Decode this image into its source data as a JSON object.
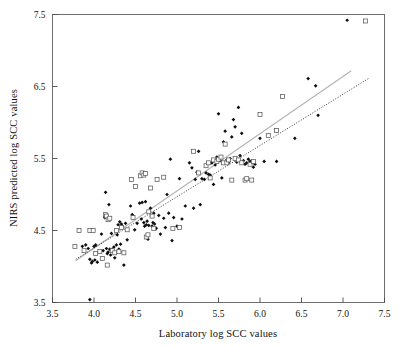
{
  "chart_data": {
    "type": "scatter",
    "title": "",
    "xlabel": "Laboratory log SCC values",
    "ylabel": "NIRS predicted log SCC values",
    "xlim": [
      3.5,
      7.5
    ],
    "ylim": [
      3.5,
      7.5
    ],
    "grid": false,
    "legend_position": "none",
    "xticks": [
      3.5,
      4.0,
      4.5,
      5.0,
      5.5,
      6.0,
      6.5,
      7.0,
      7.5
    ],
    "xtick_labels": [
      "3.5",
      "4.0",
      "4.5",
      "5.0",
      "5.5",
      "6.0",
      "6.5",
      "7.0",
      "7.5"
    ],
    "yticks": [
      3.5,
      4.5,
      5.5,
      6.5,
      7.5
    ],
    "ytick_labels": [
      "3.5",
      "4.5",
      "5.5",
      "6.5",
      "7.5"
    ],
    "marker_colors": {
      "filled_diamond": "#0d0d0d",
      "open_square_edge": "#5a5a5a",
      "open_square_fill": "#ffffff",
      "solid_fit_line": "#b4b4b4",
      "dotted_fit_line": "#2b2b2b",
      "frame": "#6d6d6d"
    },
    "series": [
      {
        "name": "calibration-set",
        "marker": "filled-diamond",
        "points": [
          [
            3.86,
            4.28
          ],
          [
            3.9,
            4.3
          ],
          [
            3.93,
            4.25
          ],
          [
            3.95,
            3.54
          ],
          [
            3.95,
            4.1
          ],
          [
            3.97,
            4.05
          ],
          [
            3.98,
            4.07
          ],
          [
            4.0,
            4.28
          ],
          [
            4.01,
            4.09
          ],
          [
            4.02,
            4.3
          ],
          [
            4.04,
            4.06
          ],
          [
            4.07,
            4.21
          ],
          [
            4.09,
            4.45
          ],
          [
            4.11,
            4.22
          ],
          [
            4.13,
            4.68
          ],
          [
            4.14,
            5.03
          ],
          [
            4.15,
            4.25
          ],
          [
            4.16,
            4.18
          ],
          [
            4.17,
            4.2
          ],
          [
            4.18,
            4.86
          ],
          [
            4.19,
            4.24
          ],
          [
            4.2,
            4.16
          ],
          [
            4.21,
            4.46
          ],
          [
            4.22,
            4.24
          ],
          [
            4.24,
            4.27
          ],
          [
            4.25,
            4.12
          ],
          [
            4.27,
            4.3
          ],
          [
            4.28,
            4.44
          ],
          [
            4.29,
            4.58
          ],
          [
            4.3,
            4.24
          ],
          [
            4.31,
            4.62
          ],
          [
            4.32,
            4.31
          ],
          [
            4.33,
            4.59
          ],
          [
            4.34,
            4.56
          ],
          [
            4.35,
            4.2
          ],
          [
            4.36,
            4.02
          ],
          [
            4.38,
            4.6
          ],
          [
            4.4,
            4.37
          ],
          [
            4.44,
            4.84
          ],
          [
            4.46,
            4.72
          ],
          [
            4.47,
            4.7
          ],
          [
            4.49,
            4.51
          ],
          [
            4.52,
            4.6
          ],
          [
            4.55,
            4.88
          ],
          [
            4.57,
            4.66
          ],
          [
            4.58,
            4.89
          ],
          [
            4.6,
            4.61
          ],
          [
            4.61,
            4.56
          ],
          [
            4.62,
            4.9
          ],
          [
            4.63,
            4.58
          ],
          [
            4.64,
            4.63
          ],
          [
            4.65,
            4.38
          ],
          [
            4.66,
            4.57
          ],
          [
            4.67,
            4.76
          ],
          [
            4.68,
            4.81
          ],
          [
            4.69,
            4.7
          ],
          [
            4.7,
            4.56
          ],
          [
            4.71,
            4.61
          ],
          [
            4.72,
            4.74
          ],
          [
            4.73,
            4.59
          ],
          [
            4.75,
            4.53
          ],
          [
            4.78,
            4.71
          ],
          [
            4.8,
            4.45
          ],
          [
            4.84,
            4.67
          ],
          [
            4.86,
            4.54
          ],
          [
            4.88,
            5.0
          ],
          [
            4.9,
            4.74
          ],
          [
            4.92,
            5.49
          ],
          [
            4.94,
            4.36
          ],
          [
            4.96,
            4.68
          ],
          [
            5.0,
            4.56
          ],
          [
            5.03,
            5.22
          ],
          [
            5.06,
            4.66
          ],
          [
            5.1,
            4.84
          ],
          [
            5.15,
            5.44
          ],
          [
            5.18,
            5.37
          ],
          [
            5.2,
            4.81
          ],
          [
            5.22,
            5.21
          ],
          [
            5.24,
            5.31
          ],
          [
            5.26,
            5.6
          ],
          [
            5.28,
            4.86
          ],
          [
            5.3,
            5.22
          ],
          [
            5.33,
            5.21
          ],
          [
            5.35,
            5.3
          ],
          [
            5.38,
            5.28
          ],
          [
            5.4,
            5.27
          ],
          [
            5.42,
            5.44
          ],
          [
            5.44,
            5.14
          ],
          [
            5.46,
            5.41
          ],
          [
            5.48,
            5.52
          ],
          [
            5.5,
            6.12
          ],
          [
            5.52,
            5.47
          ],
          [
            5.54,
            5.23
          ],
          [
            5.56,
            5.73
          ],
          [
            5.58,
            5.88
          ],
          [
            5.6,
            5.48
          ],
          [
            5.62,
            5.44
          ],
          [
            5.64,
            5.5
          ],
          [
            5.66,
            5.8
          ],
          [
            5.68,
            6.04
          ],
          [
            5.7,
            5.94
          ],
          [
            5.72,
            5.45
          ],
          [
            5.74,
            6.21
          ],
          [
            5.76,
            5.54
          ],
          [
            5.78,
            5.85
          ],
          [
            5.8,
            5.47
          ],
          [
            5.82,
            5.42
          ],
          [
            5.84,
            5.44
          ],
          [
            5.86,
            5.49
          ],
          [
            5.88,
            5.46
          ],
          [
            5.92,
            5.38
          ],
          [
            5.94,
            5.42
          ],
          [
            6.0,
            5.78
          ],
          [
            6.05,
            5.46
          ],
          [
            6.2,
            5.46
          ],
          [
            6.42,
            5.78
          ],
          [
            6.58,
            6.61
          ],
          [
            6.67,
            6.51
          ],
          [
            6.7,
            6.1
          ],
          [
            7.05,
            7.42
          ]
        ]
      },
      {
        "name": "validation-set",
        "marker": "open-square",
        "points": [
          [
            3.77,
            4.28
          ],
          [
            3.82,
            4.5
          ],
          [
            3.88,
            4.22
          ],
          [
            3.95,
            4.5
          ],
          [
            3.99,
            4.5
          ],
          [
            4.02,
            4.18
          ],
          [
            4.07,
            4.21
          ],
          [
            4.1,
            4.11
          ],
          [
            4.14,
            4.72
          ],
          [
            4.15,
            4.7
          ],
          [
            4.16,
            4.02
          ],
          [
            4.17,
            4.65
          ],
          [
            4.19,
            4.67
          ],
          [
            4.22,
            4.22
          ],
          [
            4.25,
            4.19
          ],
          [
            4.27,
            4.5
          ],
          [
            4.3,
            4.21
          ],
          [
            4.33,
            4.54
          ],
          [
            4.36,
            4.19
          ],
          [
            4.4,
            4.51
          ],
          [
            4.45,
            5.21
          ],
          [
            4.47,
            4.68
          ],
          [
            4.5,
            5.11
          ],
          [
            4.56,
            5.26
          ],
          [
            4.58,
            5.3
          ],
          [
            4.6,
            5.27
          ],
          [
            4.62,
            5.29
          ],
          [
            4.63,
            4.41
          ],
          [
            4.65,
            4.44
          ],
          [
            4.66,
            4.76
          ],
          [
            4.68,
            5.09
          ],
          [
            4.7,
            4.7
          ],
          [
            4.72,
            4.53
          ],
          [
            4.76,
            5.21
          ],
          [
            4.84,
            5.24
          ],
          [
            4.95,
            4.53
          ],
          [
            5.03,
            4.54
          ],
          [
            5.2,
            5.6
          ],
          [
            5.26,
            5.3
          ],
          [
            5.35,
            5.4
          ],
          [
            5.38,
            5.44
          ],
          [
            5.4,
            5.23
          ],
          [
            5.44,
            5.48
          ],
          [
            5.48,
            5.46
          ],
          [
            5.5,
            5.49
          ],
          [
            5.53,
            5.52
          ],
          [
            5.56,
            5.44
          ],
          [
            5.58,
            5.7
          ],
          [
            5.6,
            5.44
          ],
          [
            5.62,
            5.48
          ],
          [
            5.66,
            5.2
          ],
          [
            5.7,
            5.5
          ],
          [
            5.74,
            5.48
          ],
          [
            5.78,
            5.44
          ],
          [
            5.82,
            5.2
          ],
          [
            5.84,
            5.22
          ],
          [
            5.88,
            5.42
          ],
          [
            5.9,
            5.2
          ],
          [
            5.92,
            5.46
          ],
          [
            6.0,
            6.11
          ],
          [
            6.1,
            5.82
          ],
          [
            6.2,
            5.89
          ],
          [
            6.27,
            6.36
          ],
          [
            7.27,
            7.41
          ]
        ]
      }
    ],
    "fit_lines": [
      {
        "name": "regression-line-solid",
        "style": "solid",
        "color": "#b4b4b4",
        "x_start": 3.78,
        "y_start": 4.08,
        "x_end": 7.1,
        "y_end": 6.72
      },
      {
        "name": "regression-line-dotted",
        "style": "dotted",
        "color": "#2b2b2b",
        "x_start": 3.78,
        "y_start": 4.1,
        "x_end": 7.32,
        "y_end": 6.62
      }
    ]
  }
}
